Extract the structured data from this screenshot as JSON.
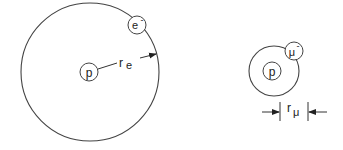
{
  "diagram": {
    "hydrogen_atom": {
      "nucleus_label": "p",
      "orbiting_particle_label": "e",
      "orbiting_particle_charge": "-",
      "radius_label": "r",
      "radius_subscript": "e"
    },
    "muonic_atom": {
      "nucleus_label": "p",
      "orbiting_particle_label": "μ",
      "orbiting_particle_charge": "-",
      "radius_label": "r",
      "radius_subscript": "μ"
    },
    "colors": {
      "stroke": "#333333",
      "background": "#ffffff"
    }
  }
}
